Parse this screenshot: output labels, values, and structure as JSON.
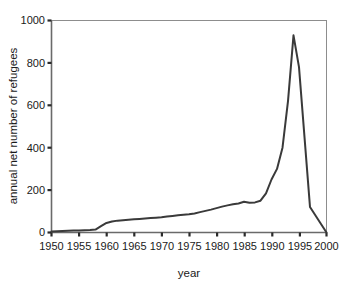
{
  "chart_data": {
    "type": "line",
    "title": "",
    "xlabel": "year",
    "ylabel": "annual net number of refugees",
    "xlim": [
      1950,
      2000
    ],
    "ylim": [
      0,
      1000
    ],
    "grid": false,
    "legend": null,
    "xticks": [
      1950,
      1955,
      1960,
      1965,
      1970,
      1975,
      1980,
      1985,
      1990,
      1995,
      2000
    ],
    "yticks": [
      0,
      200,
      400,
      600,
      800,
      1000
    ],
    "xtick_labels": [
      "1950",
      "1955",
      "1960",
      "1965",
      "1970",
      "1975",
      "1980",
      "1985",
      "1990",
      "1995",
      "2000"
    ],
    "ytick_labels": [
      "0",
      "200",
      "400",
      "600",
      "800",
      "1000"
    ],
    "line_color": "#3a3a3a",
    "line_width": 2,
    "series": [
      {
        "name": "annual net number of refugees",
        "x": [
          1950,
          1951,
          1952,
          1953,
          1954,
          1955,
          1956,
          1957,
          1958,
          1959,
          1960,
          1961,
          1962,
          1963,
          1964,
          1965,
          1966,
          1967,
          1968,
          1969,
          1970,
          1971,
          1972,
          1973,
          1974,
          1975,
          1976,
          1977,
          1978,
          1979,
          1980,
          1981,
          1982,
          1983,
          1984,
          1985,
          1986,
          1987,
          1988,
          1989,
          1990,
          1991,
          1992,
          1993,
          1994,
          1995,
          1996,
          1997,
          1998,
          1999,
          2000
        ],
        "y": [
          5,
          6,
          7,
          8,
          9,
          10,
          11,
          12,
          14,
          30,
          45,
          52,
          56,
          58,
          60,
          62,
          64,
          66,
          68,
          70,
          72,
          75,
          78,
          81,
          84,
          86,
          90,
          96,
          102,
          108,
          115,
          122,
          128,
          133,
          137,
          145,
          140,
          142,
          150,
          185,
          250,
          300,
          400,
          620,
          930,
          780,
          450,
          120,
          80,
          40,
          0
        ]
      }
    ]
  },
  "axes": {
    "y_axis_title": "annual net number of refugees",
    "x_axis_title": "year"
  }
}
